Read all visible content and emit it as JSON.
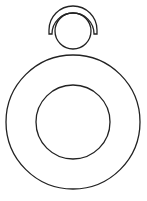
{
  "diagram": {
    "stroke_color": "#222222",
    "background": "#ffffff",
    "head": {
      "circle": {
        "cx": 73,
        "cy": 31,
        "r": 18
      },
      "cap_arc_inner": {
        "cx": 73,
        "cy": 30,
        "r": 21
      },
      "cap_arc_outer": {
        "cx": 73,
        "cy": 30,
        "r": 24
      }
    },
    "ring": {
      "outer_circle": {
        "cx": 73,
        "cy": 122,
        "r": 67
      },
      "inner_circle": {
        "cx": 73,
        "cy": 122,
        "r": 37
      }
    }
  }
}
